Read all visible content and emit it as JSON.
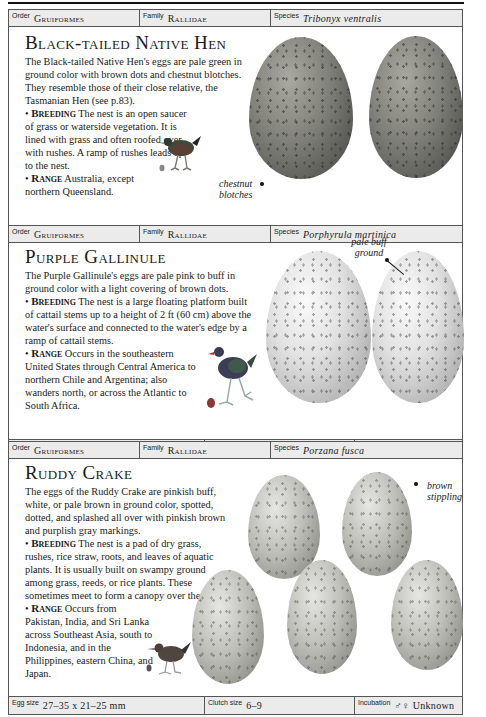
{
  "sections": [
    {
      "header": {
        "order_label": "Order",
        "order": "Gruiformes",
        "family_label": "Family",
        "family": "Rallidae",
        "species_label": "Species",
        "species": "Tribonyx ventralis"
      },
      "title": "Black-tailed Native Hen",
      "intro": "The Black-tailed Native Hen's eggs are pale green in ground color with brown dots and chestnut blotches. They resemble those of their close relative, the Tasmanian Hen (see p.83).",
      "breeding_label": "Breeding",
      "breeding": "The nest is an open saucer of grass or waterside vegetation. It is lined with grass and often roofed over with rushes. A ramp of rushes leads up to the nest.",
      "range_label": "Range",
      "range": "Australia, except northern Queensland.",
      "annotation": "chestnut blotches",
      "footer": {
        "egg_size_label": "Egg size",
        "egg_size": "43–49 x 29–34 mm",
        "clutch_label": "Clutch size",
        "clutch": "5–7",
        "incubation_label": "Incubation",
        "incubation": "Unknown"
      }
    },
    {
      "header": {
        "order_label": "Order",
        "order": "Gruiformes",
        "family_label": "Family",
        "family": "Rallidae",
        "species_label": "Species",
        "species": "Porphyrula martinica"
      },
      "title": "Purple Gallinule",
      "intro": "The Purple Gallinule's eggs are pale pink to buff in ground color with a light covering of brown dots.",
      "breeding_label": "Breeding",
      "breeding": "The nest is a large floating platform built of cattail stems up to a height of 2 ft (60 cm) above the water's surface and connected to the water's edge by a ramp of cattail stems.",
      "range_label": "Range",
      "range": "Occurs in the southeastern United States through Central America to northern Chile and Argentina; also wanders north, or across the Atlantic to South Africa.",
      "annotation": "pale buff ground",
      "footer": {
        "egg_size_label": "Egg size",
        "egg_size": "34–44 x 26–30 mm",
        "clutch_label": "Clutch size",
        "clutch": "4–10",
        "incubation_label": "Incubation",
        "incubation": "Unknown"
      }
    },
    {
      "header": {
        "order_label": "Order",
        "order": "Gruiformes",
        "family_label": "Family",
        "family": "Rallidae",
        "species_label": "Species",
        "species": "Porzana fusca"
      },
      "title": "Ruddy Crake",
      "intro": "The eggs of the Ruddy Crake are pinkish buff, white, or pale brown in ground color, spotted, dotted, and splashed all over with pinkish brown and purplish gray markings.",
      "breeding_label": "Breeding",
      "breeding": "The nest is a pad of dry grass, rushes, rice straw, roots, and leaves of aquatic plants. It is usually built on swampy ground among grass, reeds, or rice plants. These sometimes meet to form a canopy over the nest.",
      "range_label": "Range",
      "range": "Occurs from Pakistan, India, and Sri Lanka across Southeast Asia, south to Indonesia, and in the Philippines, eastern China, and Japan.",
      "annotation": "brown stippling",
      "footer": {
        "egg_size_label": "Egg size",
        "egg_size": "27–35 x 21–25 mm",
        "clutch_label": "Clutch size",
        "clutch": "6–9",
        "incubation_label": "Incubation",
        "incubation": "♂♀ Unknown"
      }
    }
  ]
}
